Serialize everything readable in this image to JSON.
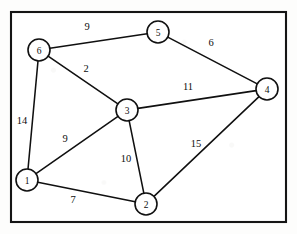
{
  "figure": {
    "type": "undirected-weighted-graph",
    "frame": {
      "x": 11,
      "y": 12,
      "width": 275,
      "height": 210
    },
    "canvas": {
      "width": 297,
      "height": 234
    },
    "colors": {
      "background": "#ffffff",
      "stroke": "#101010",
      "node_fill": "#ffffff",
      "frame_stroke": "#151515"
    }
  },
  "graph_data": {
    "type": "graph",
    "node_radius": 11,
    "nodes": [
      {
        "id": "1",
        "label": "1",
        "x": 27,
        "y": 180
      },
      {
        "id": "2",
        "label": "2",
        "x": 146,
        "y": 204
      },
      {
        "id": "3",
        "label": "3",
        "x": 127,
        "y": 110
      },
      {
        "id": "4",
        "label": "4",
        "x": 267,
        "y": 89
      },
      {
        "id": "5",
        "label": "5",
        "x": 158,
        "y": 32
      },
      {
        "id": "6",
        "label": "6",
        "x": 39,
        "y": 50
      }
    ],
    "edges": [
      {
        "source": "6",
        "target": "5",
        "weight": 9,
        "label": "9",
        "label_x": 87,
        "label_y": 26
      },
      {
        "source": "5",
        "target": "4",
        "weight": 6,
        "label": "6",
        "label_x": 211,
        "label_y": 42
      },
      {
        "source": "6",
        "target": "3",
        "weight": 2,
        "label": "2",
        "label_x": 86,
        "label_y": 68
      },
      {
        "source": "6",
        "target": "1",
        "weight": 14,
        "label": "14",
        "label_x": 22,
        "label_y": 120
      },
      {
        "source": "3",
        "target": "4",
        "weight": 11,
        "label": "11",
        "label_x": 188,
        "label_y": 86
      },
      {
        "source": "3",
        "target": "1",
        "weight": 9,
        "label": "9",
        "label_x": 65,
        "label_y": 138
      },
      {
        "source": "3",
        "target": "2",
        "weight": 10,
        "label": "10",
        "label_x": 126,
        "label_y": 158
      },
      {
        "source": "1",
        "target": "2",
        "weight": 7,
        "label": "7",
        "label_x": 73,
        "label_y": 199
      },
      {
        "source": "2",
        "target": "4",
        "weight": 15,
        "label": "15",
        "label_x": 196,
        "label_y": 143
      }
    ]
  }
}
